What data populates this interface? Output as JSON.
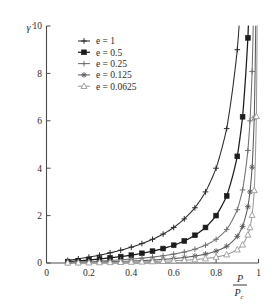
{
  "figure": {
    "name": "strain-rate-vs-normalized-pressure-plot",
    "background": "#ffffff"
  },
  "axes": {
    "y_title": "γ̇",
    "x_title_numerator": "P",
    "x_title_denominator": "P",
    "x_title_denominator_subscript": "c",
    "x_ticks": [
      "0",
      "0.2",
      "0.4",
      "0.6",
      "0.8",
      "1"
    ],
    "y_ticks": [
      "0",
      "2",
      "4",
      "6",
      "8",
      "10"
    ]
  },
  "legend": {
    "entries": [
      {
        "label": "e = 1",
        "marker": "plus-icon",
        "color": "#2a2a2a",
        "filled": true
      },
      {
        "label": "e = 0.5",
        "marker": "filled-square-icon",
        "color": "#1c1c1c",
        "filled": true
      },
      {
        "label": "e = 0.25",
        "marker": "plus-icon",
        "color": "#707070",
        "filled": true
      },
      {
        "label": "e = 0.125",
        "marker": "asterisk-icon",
        "color": "#5a5a5a",
        "filled": true
      },
      {
        "label": "e = 0.0625",
        "marker": "open-triangle-icon",
        "color": "#9a9a9a",
        "filled": false
      }
    ]
  },
  "chart_data": {
    "type": "line",
    "title": "",
    "xlabel": "P/P_c",
    "ylabel": "γ̇",
    "xlim": [
      0,
      1
    ],
    "ylim": [
      0,
      10
    ],
    "grid": false,
    "legend_position": "upper-left-inside",
    "xticks": [
      0,
      0.2,
      0.4,
      0.6,
      0.8,
      1
    ],
    "yticks": [
      0,
      2,
      4,
      6,
      8,
      10
    ],
    "x": [
      0.1,
      0.15,
      0.2,
      0.25,
      0.3,
      0.35,
      0.4,
      0.45,
      0.5,
      0.55,
      0.6,
      0.65,
      0.7,
      0.75,
      0.8,
      0.85,
      0.9,
      0.925,
      0.95,
      0.96,
      0.97,
      0.98,
      0.99,
      0.995
    ],
    "series": [
      {
        "name": "e = 1",
        "marker": "plus",
        "color": "#2a2a2a",
        "values": [
          0.11,
          0.18,
          0.25,
          0.33,
          0.43,
          0.54,
          0.67,
          0.82,
          1.0,
          1.22,
          1.5,
          1.86,
          2.33,
          3.0,
          4.0,
          5.67,
          9.0,
          12.3,
          19.0,
          24.0,
          32.3,
          49.0,
          99.0,
          199.0
        ]
      },
      {
        "name": "e = 0.5",
        "marker": "filled-square",
        "color": "#1c1c1c",
        "values": [
          0.06,
          0.09,
          0.13,
          0.17,
          0.22,
          0.27,
          0.33,
          0.41,
          0.5,
          0.61,
          0.75,
          0.93,
          1.17,
          1.5,
          2.0,
          2.83,
          4.5,
          6.17,
          9.5,
          12.0,
          16.2,
          24.5,
          49.5,
          99.5
        ]
      },
      {
        "name": "e = 0.25",
        "marker": "plus",
        "color": "#707070",
        "values": [
          0.028,
          0.044,
          0.063,
          0.083,
          0.107,
          0.135,
          0.167,
          0.205,
          0.25,
          0.306,
          0.375,
          0.464,
          0.583,
          0.75,
          1.0,
          1.417,
          2.25,
          3.083,
          4.75,
          6.0,
          8.083,
          12.25,
          24.75,
          49.75
        ]
      },
      {
        "name": "e = 0.125",
        "marker": "asterisk",
        "color": "#5a5a5a",
        "values": [
          0.014,
          0.022,
          0.031,
          0.042,
          0.054,
          0.067,
          0.083,
          0.102,
          0.125,
          0.153,
          0.188,
          0.232,
          0.292,
          0.375,
          0.5,
          0.708,
          1.125,
          1.542,
          2.375,
          3.0,
          4.042,
          6.125,
          12.375,
          24.875
        ]
      },
      {
        "name": "e = 0.0625",
        "marker": "open-triangle",
        "color": "#9a9a9a",
        "values": [
          0.007,
          0.011,
          0.016,
          0.021,
          0.027,
          0.034,
          0.042,
          0.051,
          0.063,
          0.076,
          0.094,
          0.116,
          0.146,
          0.188,
          0.25,
          0.354,
          0.563,
          0.771,
          1.188,
          1.5,
          2.021,
          3.063,
          6.188,
          12.44
        ]
      }
    ]
  }
}
